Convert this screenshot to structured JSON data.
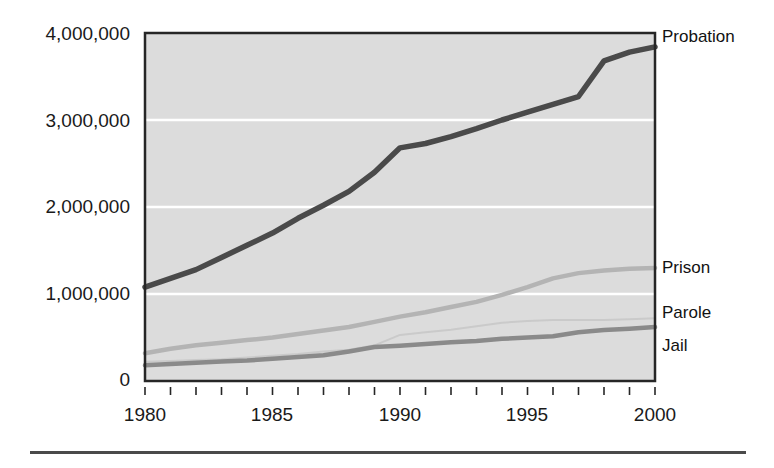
{
  "chart_data": {
    "type": "line",
    "title": "",
    "subtitle": "",
    "xlabel": "",
    "ylabel": "",
    "xlim": [
      1980,
      2000
    ],
    "ylim": [
      0,
      4000000
    ],
    "grid": "horizontal-white-gridlines",
    "legend_position": "right-of-plot-at-line-end",
    "x": [
      1980,
      1981,
      1982,
      1983,
      1984,
      1985,
      1986,
      1987,
      1988,
      1989,
      1990,
      1991,
      1992,
      1993,
      1994,
      1995,
      1996,
      1997,
      1998,
      1999,
      2000
    ],
    "y_ticks": [
      0,
      1000000,
      2000000,
      3000000,
      4000000
    ],
    "y_tick_labels": [
      "0",
      "1,000,000",
      "2,000,000",
      "3,000,000",
      "4,000,000"
    ],
    "x_ticks": [
      1980,
      1981,
      1982,
      1983,
      1984,
      1985,
      1986,
      1987,
      1988,
      1989,
      1990,
      1991,
      1992,
      1993,
      1994,
      1995,
      1996,
      1997,
      1998,
      1999,
      2000
    ],
    "x_tick_labels_shown": [
      "1980",
      "1985",
      "1990",
      "1995",
      "2000"
    ],
    "x_tick_labels_shown_values": [
      1980,
      1985,
      1990,
      1995,
      2000
    ],
    "series": [
      {
        "name": "Probation",
        "color": "#4a4a4a",
        "width": 5.5,
        "values": [
          1080000,
          1180000,
          1280000,
          1420000,
          1560000,
          1700000,
          1870000,
          2020000,
          2180000,
          2400000,
          2680000,
          2730000,
          2810000,
          2900000,
          3000000,
          3090000,
          3180000,
          3270000,
          3680000,
          3780000,
          3840000
        ]
      },
      {
        "name": "Prison",
        "color": "#b4b4b4",
        "width": 4.5,
        "values": [
          320000,
          370000,
          410000,
          440000,
          470000,
          500000,
          540000,
          580000,
          620000,
          680000,
          740000,
          790000,
          850000,
          910000,
          990000,
          1080000,
          1180000,
          1240000,
          1270000,
          1290000,
          1300000
        ]
      },
      {
        "name": "Parole",
        "color": "#cacaca",
        "width": 2.0,
        "values": [
          220000,
          230000,
          240000,
          250000,
          270000,
          290000,
          310000,
          340000,
          360000,
          410000,
          530000,
          560000,
          590000,
          630000,
          670000,
          690000,
          700000,
          700000,
          700000,
          710000,
          720000
        ]
      },
      {
        "name": "Jail",
        "color": "#8a8a8a",
        "width": 4.5,
        "values": [
          180000,
          195000,
          210000,
          225000,
          235000,
          255000,
          275000,
          295000,
          340000,
          390000,
          405000,
          425000,
          445000,
          460000,
          485000,
          500000,
          515000,
          560000,
          585000,
          600000,
          620000
        ]
      }
    ]
  },
  "axis": {
    "y_labels": [
      "4,000,000",
      "3,000,000",
      "2,000,000",
      "1,000,000",
      "0"
    ],
    "x_labels": [
      "1980",
      "1985",
      "1990",
      "1995",
      "2000"
    ]
  },
  "legend": {
    "items": [
      {
        "label": "Probation"
      },
      {
        "label": "Prison"
      },
      {
        "label": "Parole"
      },
      {
        "label": "Jail"
      }
    ]
  },
  "colors": {
    "plot_background": "#dcdcdc",
    "gridline": "#ffffff",
    "axis": "#262626",
    "text": "#1a1a1a",
    "rule": "#4a4a4a"
  }
}
